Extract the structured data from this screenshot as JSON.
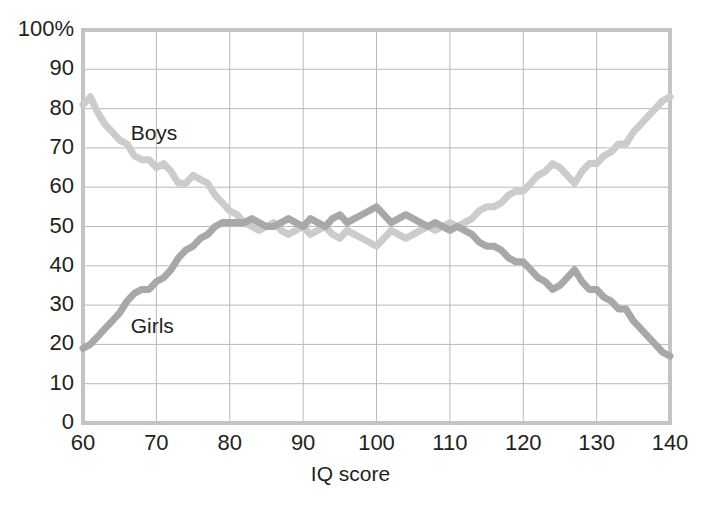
{
  "chart_data": {
    "type": "line",
    "title": "",
    "xlabel": "IQ score",
    "ylabel": "",
    "xlim": [
      60,
      140
    ],
    "ylim": [
      0,
      100
    ],
    "grid": true,
    "legend_position": "inline-annotations",
    "xticks": [
      "60",
      "70",
      "80",
      "90",
      "100",
      "110",
      "120",
      "130",
      "140"
    ],
    "xtick_values": [
      60,
      70,
      80,
      90,
      100,
      110,
      120,
      130,
      140
    ],
    "yticks": [
      "0",
      "10",
      "20",
      "30",
      "40",
      "50",
      "60",
      "70",
      "80",
      "90",
      "100%"
    ],
    "ytick_values": [
      0,
      10,
      20,
      30,
      40,
      50,
      60,
      70,
      80,
      90,
      100
    ],
    "x": [
      60,
      61,
      62,
      63,
      64,
      65,
      66,
      67,
      68,
      69,
      70,
      71,
      72,
      73,
      74,
      75,
      76,
      77,
      78,
      79,
      80,
      81,
      82,
      83,
      84,
      85,
      86,
      87,
      88,
      89,
      90,
      91,
      92,
      93,
      94,
      95,
      96,
      97,
      98,
      99,
      100,
      101,
      102,
      103,
      104,
      105,
      106,
      107,
      108,
      109,
      110,
      111,
      112,
      113,
      114,
      115,
      116,
      117,
      118,
      119,
      120,
      121,
      122,
      123,
      124,
      125,
      126,
      127,
      128,
      129,
      130,
      131,
      132,
      133,
      134,
      135,
      136,
      137,
      138,
      139,
      140
    ],
    "series": [
      {
        "name": "Boys",
        "color": "#cccccc",
        "label_x": 66.5,
        "label_y": 74,
        "values": [
          81,
          83,
          79,
          76,
          74,
          72,
          71,
          68,
          67,
          67,
          65,
          66,
          64,
          61,
          61,
          63,
          62,
          61,
          58,
          56,
          54,
          53,
          51,
          50,
          49,
          50,
          51,
          49,
          48,
          49,
          50,
          48,
          49,
          50,
          48,
          47,
          49,
          48,
          47,
          46,
          45,
          47,
          49,
          48,
          47,
          48,
          49,
          50,
          49,
          50,
          51,
          50,
          51,
          52,
          54,
          55,
          55,
          56,
          58,
          59,
          59,
          61,
          63,
          64,
          66,
          65,
          63,
          61,
          64,
          66,
          66,
          68,
          69,
          71,
          71,
          74,
          76,
          78,
          80,
          82,
          83
        ]
      },
      {
        "name": "Girls",
        "color": "#a8a8a8",
        "label_x": 66.5,
        "label_y": 25,
        "values": [
          19,
          20,
          22,
          24,
          26,
          28,
          31,
          33,
          34,
          34,
          36,
          37,
          39,
          42,
          44,
          45,
          47,
          48,
          50,
          51,
          51,
          51,
          51,
          52,
          51,
          50,
          50,
          51,
          52,
          51,
          50,
          52,
          51,
          50,
          52,
          53,
          51,
          52,
          53,
          54,
          55,
          53,
          51,
          52,
          53,
          52,
          51,
          50,
          51,
          50,
          49,
          50,
          49,
          48,
          46,
          45,
          45,
          44,
          42,
          41,
          41,
          39,
          37,
          36,
          34,
          35,
          37,
          39,
          36,
          34,
          34,
          32,
          31,
          29,
          29,
          26,
          24,
          22,
          20,
          18,
          17
        ]
      }
    ]
  },
  "axes": {
    "x_title": "IQ score",
    "y_top_label": "100%"
  }
}
